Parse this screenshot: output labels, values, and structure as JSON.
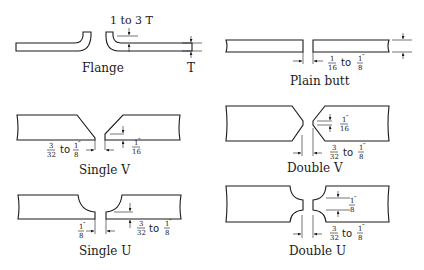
{
  "diagram": {
    "joints": [
      {
        "id": "flange",
        "label": "Flange",
        "dimensions": {
          "flange_height": "1 to 3 T",
          "thickness": "T"
        }
      },
      {
        "id": "plain-butt",
        "label": "Plain butt",
        "dimensions": {
          "gap_from": {
            "num": "1",
            "den": "16"
          },
          "to": "to",
          "gap_to": {
            "num": "1",
            "den": "8"
          },
          "unit": "″"
        }
      },
      {
        "id": "single-v",
        "label": "Single V",
        "dimensions": {
          "gap_from": {
            "num": "3",
            "den": "32"
          },
          "to": "to",
          "gap_to": {
            "num": "1",
            "den": "8"
          },
          "unit": "″",
          "root_face": {
            "num": "1",
            "den": "16"
          }
        }
      },
      {
        "id": "double-v",
        "label": "Double V",
        "dimensions": {
          "root_face": {
            "num": "1",
            "den": "16"
          },
          "gap_from": {
            "num": "3",
            "den": "32"
          },
          "to": "to",
          "gap_to": {
            "num": "1",
            "den": "8"
          },
          "unit": "″"
        }
      },
      {
        "id": "single-u",
        "label": "Single U",
        "dimensions": {
          "gap": {
            "num": "1",
            "den": "8"
          },
          "unit": "″",
          "root_from": {
            "num": "3",
            "den": "32"
          },
          "to": "to",
          "root_to": {
            "num": "1",
            "den": "8"
          }
        }
      },
      {
        "id": "double-u",
        "label": "Double U",
        "dimensions": {
          "root_face": {
            "num": "1",
            "den": "8"
          },
          "gap_from": {
            "num": "3",
            "den": "32"
          },
          "to": "to",
          "gap_to": {
            "num": "1",
            "den": "8"
          },
          "unit": "″"
        }
      }
    ]
  }
}
